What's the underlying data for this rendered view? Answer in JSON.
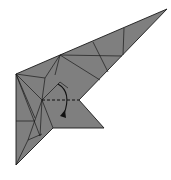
{
  "diagram": {
    "paper_color": "#7f7f7f",
    "line_color": "#1a1a1a",
    "background": "#ffffff",
    "instruction": "Valley fold the flap down along the dashed line",
    "fold_line": "valley-fold-dashed",
    "arrow": "fold-down-arrow"
  }
}
